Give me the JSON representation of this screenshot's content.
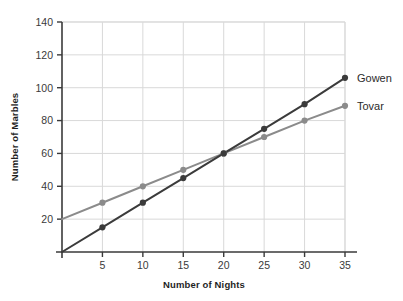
{
  "chart_data": {
    "type": "line",
    "title": "",
    "xlabel": "Number of Nights",
    "ylabel": "Number of Marbles",
    "x": [
      0,
      5,
      10,
      15,
      20,
      25,
      30,
      35
    ],
    "xlim": [
      0,
      35
    ],
    "ylim": [
      0,
      140
    ],
    "xticks": [
      5,
      10,
      15,
      20,
      25,
      30,
      35
    ],
    "yticks": [
      20,
      40,
      60,
      80,
      100,
      120,
      140
    ],
    "grid": true,
    "legend_position": "right-inline",
    "series": [
      {
        "name": "Gowen",
        "color": "#3b3b3b",
        "values": [
          0,
          15,
          30,
          45,
          60,
          75,
          90,
          106
        ]
      },
      {
        "name": "Tovar",
        "color": "#8b8b8b",
        "values": [
          20,
          30,
          40,
          50,
          60,
          70,
          80,
          89
        ]
      }
    ]
  },
  "axes": {
    "x_title": "Number of Nights",
    "y_title": "Number of Marbles",
    "x_tick_labels": [
      "5",
      "10",
      "15",
      "20",
      "25",
      "30",
      "35"
    ],
    "y_tick_labels": [
      "20",
      "40",
      "60",
      "80",
      "100",
      "120",
      "140"
    ]
  },
  "legend": {
    "items": [
      {
        "label": "Gowen",
        "color": "#3b3b3b"
      },
      {
        "label": "Tovar",
        "color": "#8b8b8b"
      }
    ]
  },
  "colors": {
    "series_dark": "#3b3b3b",
    "series_light": "#8b8b8b",
    "grid": "#d9d9d9",
    "axis": "#3a3a3a",
    "background": "#ffffff"
  },
  "artifacts": {
    "top_fragment": ""
  }
}
